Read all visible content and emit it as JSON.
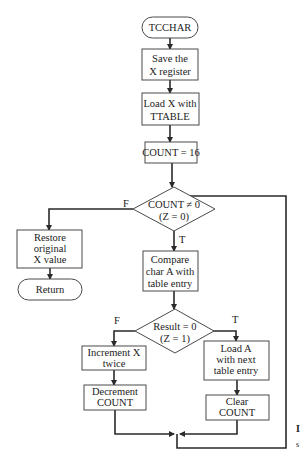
{
  "diagram": {
    "type": "flowchart",
    "nodes": {
      "start": {
        "shape": "terminal",
        "lines": [
          "TCCHAR"
        ]
      },
      "save_x": {
        "shape": "process",
        "lines": [
          "Save the",
          "X register"
        ]
      },
      "load_x": {
        "shape": "process",
        "lines": [
          "Load X with",
          "TTABLE"
        ]
      },
      "init_count": {
        "shape": "process",
        "lines": [
          "COUNT = 16"
        ]
      },
      "count_check": {
        "shape": "decision",
        "lines": [
          "COUNT ≠ 0",
          "(Z = 0)"
        ]
      },
      "restore_x": {
        "shape": "process",
        "lines": [
          "Restore",
          "original",
          "X value"
        ]
      },
      "return": {
        "shape": "terminal",
        "lines": [
          "Return"
        ]
      },
      "compare": {
        "shape": "process",
        "lines": [
          "Compare",
          "char A with",
          "table entry"
        ]
      },
      "result_check": {
        "shape": "decision",
        "lines": [
          "Result = 0",
          "(Z = 1)"
        ]
      },
      "inc_x": {
        "shape": "process",
        "lines": [
          "Increment X",
          "twice"
        ]
      },
      "dec_count": {
        "shape": "process",
        "lines": [
          "Decrement",
          "COUNT"
        ]
      },
      "load_a": {
        "shape": "process",
        "lines": [
          "Load A",
          "with next",
          "table entry"
        ]
      },
      "clear_count": {
        "shape": "process",
        "lines": [
          "Clear",
          "COUNT"
        ]
      }
    },
    "edge_labels": {
      "count_false": "F",
      "count_true": "T",
      "result_false": "F",
      "result_true": "T"
    },
    "edges": [
      {
        "from": "start",
        "to": "save_x"
      },
      {
        "from": "save_x",
        "to": "load_x"
      },
      {
        "from": "load_x",
        "to": "init_count"
      },
      {
        "from": "init_count",
        "to": "count_check"
      },
      {
        "from": "count_check",
        "to": "restore_x",
        "label": "F"
      },
      {
        "from": "restore_x",
        "to": "return"
      },
      {
        "from": "count_check",
        "to": "compare",
        "label": "T"
      },
      {
        "from": "compare",
        "to": "result_check"
      },
      {
        "from": "result_check",
        "to": "inc_x",
        "label": "F"
      },
      {
        "from": "inc_x",
        "to": "dec_count"
      },
      {
        "from": "result_check",
        "to": "load_a",
        "label": "T"
      },
      {
        "from": "load_a",
        "to": "clear_count"
      },
      {
        "from": "dec_count",
        "to": "count_check"
      },
      {
        "from": "clear_count",
        "to": "count_check"
      }
    ],
    "cropped_margin_text": [
      "I",
      "s"
    ]
  }
}
